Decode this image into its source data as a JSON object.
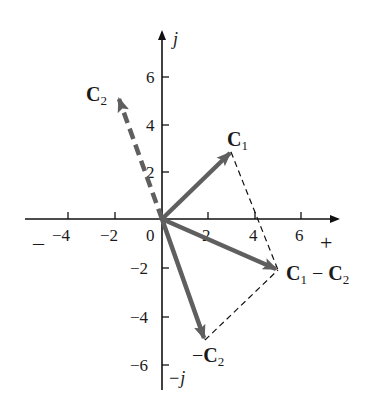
{
  "diagram": {
    "axes": {
      "real_positive_label": "+",
      "real_negative_label": "–",
      "imag_positive_label": "j",
      "imag_negative_label": "−j",
      "origin_label": "0",
      "x_ticks": [
        {
          "value": -4,
          "label": "−4"
        },
        {
          "value": -2,
          "label": "−2"
        },
        {
          "value": 2,
          "label": "2"
        },
        {
          "value": 4,
          "label": "4"
        },
        {
          "value": 6,
          "label": "6"
        }
      ],
      "y_ticks": [
        {
          "value": 6,
          "label": "6"
        },
        {
          "value": 4,
          "label": "4"
        },
        {
          "value": 2,
          "label": "2"
        },
        {
          "value": -2,
          "label": "−2"
        },
        {
          "value": -4,
          "label": "−4"
        },
        {
          "value": -6,
          "label": "−6"
        }
      ]
    },
    "vectors": [
      {
        "name": "C1",
        "label_main": "C",
        "label_sub": "1",
        "x": 3,
        "y": 3,
        "style": "solid"
      },
      {
        "name": "C2",
        "label_main": "C",
        "label_sub": "2",
        "x": -2,
        "y": 5,
        "style": "dashed"
      },
      {
        "name": "-C2",
        "label_prefix": "−",
        "label_main": "C",
        "label_sub": "2",
        "x": 2,
        "y": -5,
        "style": "solid"
      },
      {
        "name": "C1 - C2",
        "label_main": "C",
        "label_sub": "1",
        "label_mid": " − ",
        "label_main2": "C",
        "label_sub2": "2",
        "x": 5,
        "y": -2,
        "style": "solid"
      }
    ],
    "construction_lines": [
      {
        "from": [
          3,
          3
        ],
        "to": [
          5,
          -2
        ],
        "style": "dashed"
      },
      {
        "from": [
          2,
          -5
        ],
        "to": [
          5,
          -2
        ],
        "style": "dashed"
      }
    ],
    "colors": {
      "axis": "#111111",
      "vector": "#5f5f5f",
      "construction": "#111111",
      "text": "#1a1a1a"
    }
  }
}
